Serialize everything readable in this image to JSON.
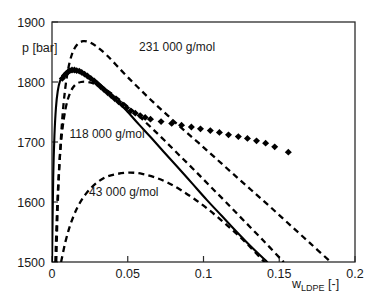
{
  "chart_data": {
    "type": "line",
    "title": "",
    "xlabel": "w_LDPE [-]",
    "xlabel_base": "w",
    "xlabel_sub": "LDPE",
    "xlabel_unit": " [-]",
    "ylabel": "p [bar]",
    "xlim": [
      0,
      0.2
    ],
    "ylim": [
      1500,
      1900
    ],
    "xticks": [
      "0",
      "0.05",
      "0.1",
      "0.15",
      "0.2"
    ],
    "xtick_values": [
      0,
      0.05,
      0.1,
      0.15,
      0.2
    ],
    "yticks": [
      "1500",
      "1600",
      "1700",
      "1800",
      "1900"
    ],
    "ytick_values": [
      1500,
      1600,
      1700,
      1800,
      1900
    ],
    "grid": false,
    "legend_position": "inline-annotations",
    "annotations": [
      {
        "text": "231 000 g/mol",
        "x": 0.0575,
        "y": 1852
      },
      {
        "text": "118 000 g/mol",
        "x": 0.0115,
        "y": 1707
      },
      {
        "text": "43 000 g/mol",
        "x": 0.0245,
        "y": 1610
      }
    ],
    "series": [
      {
        "name": "experimental cloud points",
        "style": "scatter",
        "marker": "diamond",
        "color": "#000000",
        "points": [
          [
            0.0068,
            1806
          ],
          [
            0.0082,
            1811
          ],
          [
            0.0094,
            1814
          ],
          [
            0.0106,
            1817
          ],
          [
            0.0118,
            1819
          ],
          [
            0.0132,
            1820
          ],
          [
            0.0148,
            1820
          ],
          [
            0.0163,
            1819
          ],
          [
            0.018,
            1818
          ],
          [
            0.0196,
            1816
          ],
          [
            0.0215,
            1813
          ],
          [
            0.0234,
            1810
          ],
          [
            0.0256,
            1806
          ],
          [
            0.0278,
            1802
          ],
          [
            0.03,
            1797
          ],
          [
            0.0322,
            1792
          ],
          [
            0.0345,
            1787
          ],
          [
            0.0368,
            1782
          ],
          [
            0.0392,
            1777
          ],
          [
            0.0415,
            1772
          ],
          [
            0.044,
            1767
          ],
          [
            0.0465,
            1762
          ],
          [
            0.0492,
            1757
          ],
          [
            0.052,
            1752
          ],
          [
            0.055,
            1748
          ],
          [
            0.0582,
            1744
          ],
          [
            0.0615,
            1741
          ],
          [
            0.065,
            1738
          ],
          [
            0.072,
            1734
          ],
          [
            0.079,
            1731
          ],
          [
            0.0855,
            1728
          ],
          [
            0.092,
            1725
          ],
          [
            0.098,
            1722
          ],
          [
            0.1045,
            1719
          ],
          [
            0.1105,
            1716
          ],
          [
            0.1165,
            1712
          ],
          [
            0.123,
            1709
          ],
          [
            0.129,
            1706
          ],
          [
            0.135,
            1702
          ],
          [
            0.141,
            1698
          ],
          [
            0.147,
            1692
          ],
          [
            0.156,
            1683
          ]
        ]
      },
      {
        "name": "cloud point curve (model, solid)",
        "style": "line-solid",
        "color": "#000000",
        "points": [
          [
            0.0,
            1500
          ],
          [
            0.0008,
            1640
          ],
          [
            0.0016,
            1710
          ],
          [
            0.0026,
            1757
          ],
          [
            0.0038,
            1785
          ],
          [
            0.0052,
            1801
          ],
          [
            0.007,
            1810
          ],
          [
            0.009,
            1815
          ],
          [
            0.0115,
            1817
          ],
          [
            0.0145,
            1818
          ],
          [
            0.018,
            1817
          ],
          [
            0.022,
            1813
          ],
          [
            0.0265,
            1806
          ],
          [
            0.0315,
            1796
          ],
          [
            0.037,
            1783
          ],
          [
            0.043,
            1768
          ],
          [
            0.05,
            1750
          ],
          [
            0.0575,
            1729
          ],
          [
            0.0655,
            1707
          ],
          [
            0.074,
            1683
          ],
          [
            0.083,
            1658
          ],
          [
            0.0925,
            1631
          ],
          [
            0.102,
            1604
          ],
          [
            0.112,
            1577
          ],
          [
            0.122,
            1550
          ],
          [
            0.132,
            1524
          ],
          [
            0.142,
            1500
          ]
        ]
      },
      {
        "name": "231 000 g/mol",
        "style": "line-dashed",
        "color": "#000000",
        "points": [
          [
            0.0028,
            1500
          ],
          [
            0.004,
            1610
          ],
          [
            0.0055,
            1690
          ],
          [
            0.0075,
            1760
          ],
          [
            0.01,
            1812
          ],
          [
            0.013,
            1845
          ],
          [
            0.0165,
            1862
          ],
          [
            0.0205,
            1868
          ],
          [
            0.025,
            1866
          ],
          [
            0.03,
            1858
          ],
          [
            0.036,
            1845
          ],
          [
            0.0425,
            1828
          ],
          [
            0.05,
            1808
          ],
          [
            0.058,
            1788
          ],
          [
            0.067,
            1766
          ],
          [
            0.0765,
            1744
          ],
          [
            0.0865,
            1721
          ],
          [
            0.097,
            1698
          ],
          [
            0.108,
            1673
          ],
          [
            0.1195,
            1647
          ],
          [
            0.1315,
            1620
          ],
          [
            0.144,
            1592
          ],
          [
            0.157,
            1562
          ],
          [
            0.1705,
            1531
          ],
          [
            0.184,
            1500
          ]
        ]
      },
      {
        "name": "118 000 g/mol",
        "style": "line-dashed",
        "color": "#000000",
        "points": [
          [
            0.0022,
            1500
          ],
          [
            0.0034,
            1590
          ],
          [
            0.0048,
            1660
          ],
          [
            0.0066,
            1715
          ],
          [
            0.009,
            1756
          ],
          [
            0.0118,
            1781
          ],
          [
            0.0152,
            1795
          ],
          [
            0.0192,
            1800
          ],
          [
            0.0238,
            1800
          ],
          [
            0.029,
            1796
          ],
          [
            0.035,
            1788
          ],
          [
            0.0418,
            1776
          ],
          [
            0.049,
            1761
          ],
          [
            0.057,
            1744
          ],
          [
            0.0655,
            1724
          ],
          [
            0.0745,
            1702
          ],
          [
            0.084,
            1678
          ],
          [
            0.094,
            1653
          ],
          [
            0.1045,
            1626
          ],
          [
            0.1155,
            1598
          ],
          [
            0.127,
            1568
          ],
          [
            0.139,
            1537
          ],
          [
            0.151,
            1505
          ],
          [
            0.153,
            1500
          ]
        ]
      },
      {
        "name": "43 000 g/mol",
        "style": "line-dashed",
        "color": "#000000",
        "points": [
          [
            0.006,
            1500
          ],
          [
            0.009,
            1535
          ],
          [
            0.0125,
            1565
          ],
          [
            0.017,
            1592
          ],
          [
            0.0225,
            1614
          ],
          [
            0.029,
            1631
          ],
          [
            0.036,
            1642
          ],
          [
            0.0435,
            1647
          ],
          [
            0.0515,
            1649
          ],
          [
            0.0595,
            1647
          ],
          [
            0.068,
            1641
          ],
          [
            0.0765,
            1632
          ],
          [
            0.085,
            1620
          ],
          [
            0.094,
            1605
          ],
          [
            0.103,
            1588
          ],
          [
            0.112,
            1569
          ],
          [
            0.121,
            1549
          ],
          [
            0.13,
            1527
          ],
          [
            0.139,
            1503
          ],
          [
            0.1405,
            1500
          ]
        ]
      }
    ]
  }
}
